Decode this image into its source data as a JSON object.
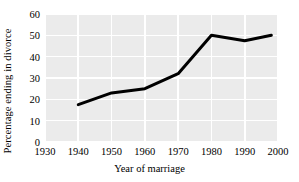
{
  "chart_data": {
    "type": "line",
    "title": "",
    "xlabel": "Year of marriage",
    "ylabel": "Percentage ending in divorce",
    "x": [
      1940,
      1950,
      1960,
      1970,
      1980,
      1990,
      1998
    ],
    "values": [
      17.5,
      23.0,
      25.0,
      32.0,
      50.0,
      47.5,
      50.0
    ],
    "series": [
      {
        "name": "Percentage ending in divorce",
        "values": [
          17.5,
          23.0,
          25.0,
          32.0,
          50.0,
          47.5,
          50.0
        ]
      }
    ],
    "xlim": [
      1930,
      2000
    ],
    "ylim": [
      0,
      60
    ],
    "xticks": [
      1930,
      1940,
      1950,
      1960,
      1970,
      1980,
      1990,
      2000
    ],
    "yticks": [
      0,
      10,
      20,
      30,
      40,
      50,
      60
    ],
    "xtick_labels": [
      "1930",
      "1940",
      "1950",
      "1960",
      "1970",
      "1980",
      "1990",
      "2000"
    ],
    "ytick_labels": [
      "0",
      "10",
      "20",
      "30",
      "40",
      "50",
      "60"
    ],
    "grid": true,
    "legend": null,
    "line_color": "#000000",
    "line_width": 3,
    "plot_background": "#ebebeb",
    "grid_color": "#ffffff",
    "figure_background": "#ffffff"
  }
}
